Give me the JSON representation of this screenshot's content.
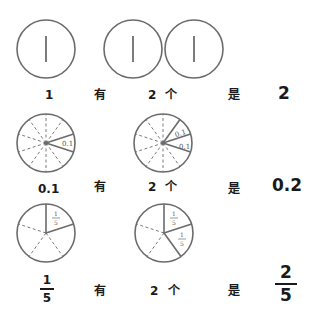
{
  "rows": [
    {
      "unit": "1",
      "you": "有",
      "count": "2",
      "ge": "个",
      "shi": "是",
      "result": "2",
      "circles": [
        {
          "label": "1"
        },
        {
          "label": "1"
        },
        {
          "label": "1"
        }
      ]
    },
    {
      "unit": "0.1",
      "you": "有",
      "count": "2",
      "ge": "个",
      "shi": "是",
      "result": "0.2",
      "divisions": 10,
      "slice_label": "0.1"
    },
    {
      "unit": {
        "numerator": "1",
        "denominator": "5"
      },
      "you": "有",
      "count": "2",
      "ge": "个",
      "shi": "是",
      "result": {
        "numerator": "2",
        "denominator": "5"
      },
      "divisions": 5,
      "slice_label": {
        "numerator": "1",
        "denominator": "5"
      }
    }
  ],
  "colors": {
    "stroke": "#6b6b6b",
    "text": "#1a1a1a"
  }
}
